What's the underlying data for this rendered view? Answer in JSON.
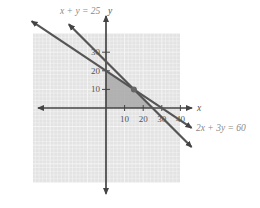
{
  "chart_data": {
    "type": "line",
    "title": "",
    "xlabel": "x",
    "ylabel": "y",
    "x_ticks": [
      10,
      20,
      30,
      40
    ],
    "x_tick_labels": [
      "10",
      "20",
      "30",
      "40"
    ],
    "y_ticks": [
      10,
      20,
      30
    ],
    "y_tick_labels": [
      "10",
      "20",
      "30"
    ],
    "xlim": [
      -40,
      40
    ],
    "ylim": [
      -40,
      40
    ],
    "grid": true,
    "series": [
      {
        "name": "2x + 3y = 60",
        "label": "2x + 3y = 60",
        "equation": {
          "a": 2,
          "b": 3,
          "c": 60
        },
        "x": [
          -40,
          46
        ],
        "y": [
          46.67,
          -10.67
        ]
      },
      {
        "name": "x + y = 25",
        "label": "x + y = 25",
        "equation": {
          "a": 1,
          "b": 1,
          "c": 25
        },
        "x": [
          -20,
          46
        ],
        "y": [
          45,
          -21
        ]
      }
    ],
    "feasible_region": {
      "vertices": [
        [
          0,
          0
        ],
        [
          0,
          20
        ],
        [
          15,
          10
        ],
        [
          25,
          0
        ]
      ],
      "color": "#a8a8a8"
    },
    "intersection_point": {
      "x": 15,
      "y": 10
    },
    "colors": {
      "grid_background": "#e3e3e3",
      "gridline": "#f6f6f6",
      "line": "#555555",
      "axis": "#444444",
      "point": "#666666"
    }
  }
}
